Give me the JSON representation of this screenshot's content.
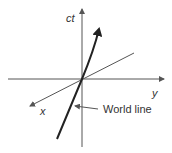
{
  "diagram": {
    "type": "spacetime-diagram",
    "axes": {
      "vertical": {
        "label": "ct"
      },
      "horizontal": {
        "label": "y"
      },
      "oblique": {
        "label": "x"
      }
    },
    "annotation": {
      "label": "World line"
    },
    "colors": {
      "axis": "#555555",
      "worldline": "#222222",
      "text": "#333333",
      "background": "#ffffff"
    }
  }
}
